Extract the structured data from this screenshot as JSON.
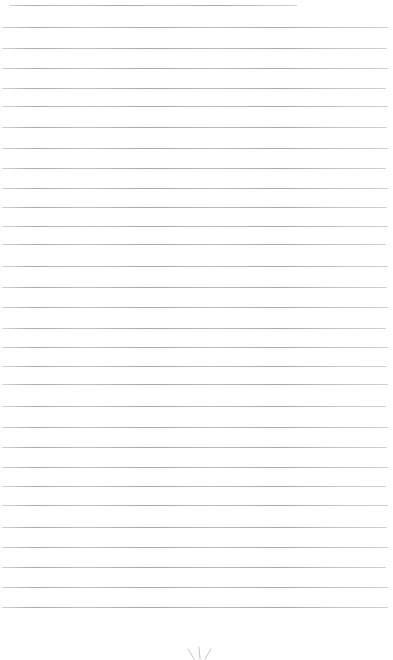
{
  "page": {
    "width_px": 393,
    "height_px": 660,
    "background_color": "#ffffff"
  },
  "ruled_lines": {
    "color": "#b3b3b3",
    "thickness_px": 1,
    "count": 31,
    "lines": [
      {
        "y": 5,
        "x1": 9,
        "x2": 297
      },
      {
        "y": 27,
        "x1": 2,
        "x2": 388
      },
      {
        "y": 48,
        "x1": 2,
        "x2": 387
      },
      {
        "y": 68,
        "x1": 2,
        "x2": 388
      },
      {
        "y": 88,
        "x1": 2,
        "x2": 386
      },
      {
        "y": 106,
        "x1": 2,
        "x2": 388
      },
      {
        "y": 127,
        "x1": 2,
        "x2": 387
      },
      {
        "y": 148,
        "x1": 2,
        "x2": 388
      },
      {
        "y": 168,
        "x1": 2,
        "x2": 386
      },
      {
        "y": 188,
        "x1": 2,
        "x2": 388
      },
      {
        "y": 207,
        "x1": 2,
        "x2": 387
      },
      {
        "y": 226,
        "x1": 2,
        "x2": 388
      },
      {
        "y": 244,
        "x1": 2,
        "x2": 386
      },
      {
        "y": 266,
        "x1": 2,
        "x2": 388
      },
      {
        "y": 287,
        "x1": 2,
        "x2": 387
      },
      {
        "y": 307,
        "x1": 2,
        "x2": 388
      },
      {
        "y": 328,
        "x1": 2,
        "x2": 386
      },
      {
        "y": 347,
        "x1": 2,
        "x2": 388
      },
      {
        "y": 366,
        "x1": 2,
        "x2": 387
      },
      {
        "y": 384,
        "x1": 2,
        "x2": 388
      },
      {
        "y": 406,
        "x1": 2,
        "x2": 386
      },
      {
        "y": 427,
        "x1": 2,
        "x2": 388
      },
      {
        "y": 447,
        "x1": 2,
        "x2": 387
      },
      {
        "y": 467,
        "x1": 2,
        "x2": 388
      },
      {
        "y": 486,
        "x1": 2,
        "x2": 386
      },
      {
        "y": 505,
        "x1": 2,
        "x2": 388
      },
      {
        "y": 527,
        "x1": 2,
        "x2": 387
      },
      {
        "y": 547,
        "x1": 2,
        "x2": 388
      },
      {
        "y": 567,
        "x1": 2,
        "x2": 386
      },
      {
        "y": 587,
        "x1": 2,
        "x2": 388
      },
      {
        "y": 607,
        "x1": 2,
        "x2": 388
      }
    ]
  },
  "bottom_mark": {
    "description": "Faint top of a three-stroke asterisk/ray mark cut off by the bottom edge, centered near x=199",
    "color": "#c4c4c4",
    "center_x": 199,
    "strokes": [
      {
        "x1": 188,
        "y1": 649,
        "x2": 194,
        "y2": 659
      },
      {
        "x1": 199,
        "y1": 647,
        "x2": 200,
        "y2": 659
      },
      {
        "x1": 211,
        "y1": 649,
        "x2": 205,
        "y2": 659
      }
    ]
  }
}
